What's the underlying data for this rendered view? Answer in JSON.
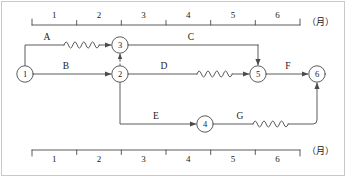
{
  "diagram": {
    "type": "arrow-network-diagram",
    "title": "",
    "unit_label": "（月）",
    "time_axis": {
      "top": {
        "ticks": [
          "1",
          "2",
          "3",
          "4",
          "5",
          "6"
        ],
        "unit": "（月）",
        "start_px": 32,
        "end_px": 300
      },
      "bottom": {
        "ticks": [
          "1",
          "2",
          "3",
          "4",
          "5",
          "6"
        ],
        "unit": "（月）",
        "start_px": 32,
        "end_px": 300
      }
    },
    "nodes": [
      {
        "id": "1",
        "label": "1",
        "x": 25,
        "y": 74
      },
      {
        "id": "2",
        "label": "2",
        "x": 120,
        "y": 74
      },
      {
        "id": "3",
        "label": "3",
        "x": 120,
        "y": 45
      },
      {
        "id": "4",
        "label": "4",
        "x": 205,
        "y": 124
      },
      {
        "id": "5",
        "label": "5",
        "x": 258,
        "y": 74
      },
      {
        "id": "6",
        "label": "6",
        "x": 317,
        "y": 74
      }
    ],
    "activities": [
      {
        "name": "A",
        "from": "1",
        "to": "3",
        "label": "A",
        "label_x": 47,
        "label_y": 33,
        "has_float": true,
        "style": "solid"
      },
      {
        "name": "B",
        "from": "1",
        "to": "2",
        "label": "B",
        "label_x": 66,
        "label_y": 63,
        "has_float": false,
        "style": "solid"
      },
      {
        "name": "C",
        "from": "3",
        "to": "5",
        "label": "C",
        "label_x": 191,
        "label_y": 33,
        "has_float": false,
        "style": "solid"
      },
      {
        "name": "D",
        "from": "2",
        "to": "5",
        "label": "D",
        "label_x": 164,
        "label_y": 63,
        "has_float": true,
        "style": "solid"
      },
      {
        "name": "E",
        "from": "2",
        "to": "4",
        "label": "E",
        "label_x": 156,
        "label_y": 113,
        "has_float": false,
        "style": "solid"
      },
      {
        "name": "F",
        "from": "5",
        "to": "6",
        "label": "F",
        "label_x": 288,
        "label_y": 63,
        "has_float": false,
        "style": "solid"
      },
      {
        "name": "G",
        "from": "4",
        "to": "6",
        "label": "G",
        "label_x": 240,
        "label_y": 113,
        "has_float": true,
        "style": "solid"
      }
    ],
    "dummy_activities": [
      {
        "from": "2",
        "to": "3",
        "style": "dashed"
      }
    ],
    "colors": {
      "line": "#4a4a4a",
      "text": "#1a1a1a",
      "frame": "#c9c9c9",
      "background": "#ffffff"
    }
  }
}
